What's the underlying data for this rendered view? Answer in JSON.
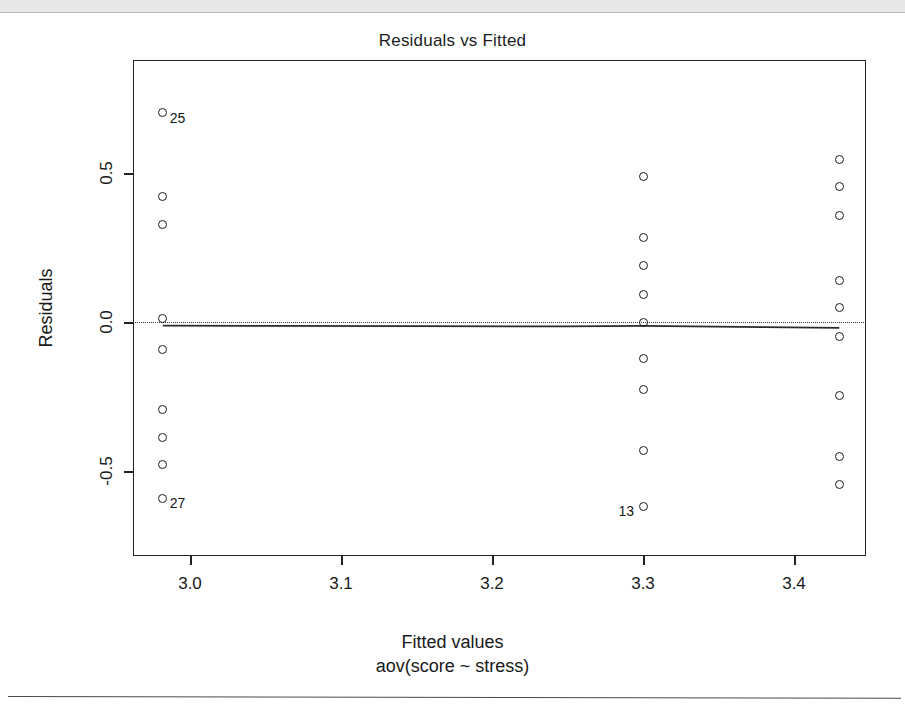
{
  "figure": {
    "title": "Residuals vs Fitted",
    "ylab": "Residuals",
    "xlab_main": "Fitted values",
    "xlab_sub": "aov(score ~ stress)"
  },
  "chart_data": {
    "type": "scatter",
    "title": "Residuals vs Fitted",
    "xlabel": "Fitted values",
    "xlabel_sub": "aov(score ~ stress)",
    "ylabel": "Residuals",
    "xlim": [
      2.955,
      3.44
    ],
    "ylim": [
      -0.72,
      0.73
    ],
    "xticks": [
      "3.0",
      "3.1",
      "3.2",
      "3.3",
      "3.4"
    ],
    "xtick_values": [
      3.0,
      3.1,
      3.2,
      3.3,
      3.4
    ],
    "yticks": [
      "0.5",
      "0.0",
      "-0.5"
    ],
    "ytick_values": [
      0.5,
      0.0,
      -0.5
    ],
    "grid": false,
    "legend": false,
    "reference_line": {
      "y": 0.0,
      "style": "dotted",
      "color": "#3a3a3a"
    },
    "smoother": {
      "type": "lowess",
      "style": "solid",
      "color": "#2a2a2a",
      "points": [
        [
          2.982,
          -0.012
        ],
        [
          3.05,
          -0.013
        ],
        [
          3.15,
          -0.014
        ],
        [
          3.25,
          -0.015
        ],
        [
          3.3,
          -0.013
        ],
        [
          3.38,
          -0.017
        ],
        [
          3.43,
          -0.02
        ]
      ]
    },
    "groups": [
      {
        "name": "group-1",
        "x": 2.982,
        "residuals": [
          0.702,
          0.422,
          0.327,
          0.013,
          -0.091,
          -0.295,
          -0.389,
          -0.477,
          -0.591
        ]
      },
      {
        "name": "group-2",
        "x": 3.3,
        "residuals": [
          0.487,
          0.285,
          0.188,
          0.091,
          -0.001,
          -0.124,
          -0.228,
          -0.43,
          -0.618
        ]
      },
      {
        "name": "group-3",
        "x": 3.43,
        "residuals": [
          0.544,
          0.456,
          0.359,
          0.138,
          0.047,
          -0.047,
          -0.245,
          -0.45,
          -0.544
        ]
      }
    ],
    "points": [
      {
        "x": 2.982,
        "y": 0.702,
        "label": "25",
        "label_side": "right"
      },
      {
        "x": 2.982,
        "y": 0.422,
        "label": null,
        "label_side": null
      },
      {
        "x": 2.982,
        "y": 0.327,
        "label": null,
        "label_side": null
      },
      {
        "x": 2.982,
        "y": 0.013,
        "label": null,
        "label_side": null
      },
      {
        "x": 2.982,
        "y": -0.091,
        "label": null,
        "label_side": null
      },
      {
        "x": 2.982,
        "y": -0.295,
        "label": null,
        "label_side": null
      },
      {
        "x": 2.982,
        "y": -0.389,
        "label": null,
        "label_side": null
      },
      {
        "x": 2.982,
        "y": -0.477,
        "label": null,
        "label_side": null
      },
      {
        "x": 2.982,
        "y": -0.591,
        "label": "27",
        "label_side": "right"
      },
      {
        "x": 3.3,
        "y": 0.487,
        "label": null,
        "label_side": null
      },
      {
        "x": 3.3,
        "y": 0.285,
        "label": null,
        "label_side": null
      },
      {
        "x": 3.3,
        "y": 0.188,
        "label": null,
        "label_side": null
      },
      {
        "x": 3.3,
        "y": 0.091,
        "label": null,
        "label_side": null
      },
      {
        "x": 3.3,
        "y": -0.001,
        "label": null,
        "label_side": null
      },
      {
        "x": 3.3,
        "y": -0.124,
        "label": null,
        "label_side": null
      },
      {
        "x": 3.3,
        "y": -0.228,
        "label": null,
        "label_side": null
      },
      {
        "x": 3.3,
        "y": -0.43,
        "label": null,
        "label_side": null
      },
      {
        "x": 3.3,
        "y": -0.618,
        "label": "13",
        "label_side": "left"
      },
      {
        "x": 3.43,
        "y": 0.544,
        "label": null,
        "label_side": null
      },
      {
        "x": 3.43,
        "y": 0.456,
        "label": null,
        "label_side": null
      },
      {
        "x": 3.43,
        "y": 0.359,
        "label": null,
        "label_side": null
      },
      {
        "x": 3.43,
        "y": 0.138,
        "label": null,
        "label_side": null
      },
      {
        "x": 3.43,
        "y": 0.047,
        "label": null,
        "label_side": null
      },
      {
        "x": 3.43,
        "y": -0.047,
        "label": null,
        "label_side": null
      },
      {
        "x": 3.43,
        "y": -0.245,
        "label": null,
        "label_side": null
      },
      {
        "x": 3.43,
        "y": -0.45,
        "label": null,
        "label_side": null
      },
      {
        "x": 3.43,
        "y": -0.544,
        "label": null,
        "label_side": null
      }
    ]
  }
}
